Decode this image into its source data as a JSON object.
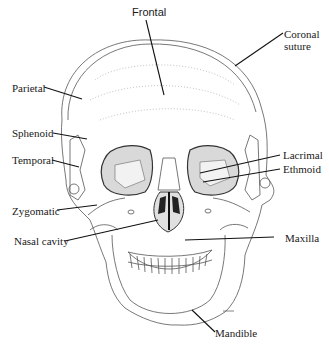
{
  "figure": {
    "labels": {
      "frontal": "Frontal",
      "coronal_suture_line1": "Coronal",
      "coronal_suture_line2": "suture",
      "parietal": "Parietal",
      "sphenoid": "Sphenoid",
      "temporal": "Temporal",
      "lacrimal": "Lacrimal",
      "ethmoid": "Ethmoid",
      "zygomatic": "Zygomatic",
      "nasal_cavity": "Nasal cavity",
      "maxilla": "Maxilla",
      "mandible": "Mandible"
    },
    "caption": "Figure 4-1  The skull (cut off)"
  }
}
